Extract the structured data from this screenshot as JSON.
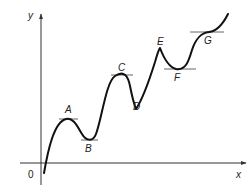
{
  "diagram": {
    "type": "function-graph-stationary-points",
    "axes": {
      "x_label": "x",
      "y_label": "y",
      "origin_label": "0"
    },
    "points": [
      {
        "id": "A",
        "label": "A",
        "kind": "local maximum"
      },
      {
        "id": "B",
        "label": "B",
        "kind": "local minimum"
      },
      {
        "id": "C",
        "label": "C",
        "kind": "local maximum"
      },
      {
        "id": "D",
        "label": "D",
        "kind": "local minimum (cusp)"
      },
      {
        "id": "E",
        "label": "E",
        "kind": "local maximum (cusp)"
      },
      {
        "id": "F",
        "label": "F",
        "kind": "local minimum"
      },
      {
        "id": "G",
        "label": "G",
        "kind": "horizontal point of inflection"
      }
    ],
    "colors": {
      "curve": "#111111",
      "axes": "#333333",
      "tangents": "#555555"
    }
  }
}
